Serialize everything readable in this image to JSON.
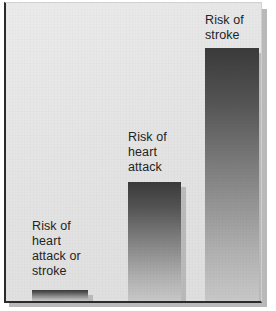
{
  "chart_data": {
    "type": "bar",
    "title": "",
    "subtitle": "",
    "xlabel": "",
    "ylabel": "",
    "grid": false,
    "legend": "none",
    "orientation": "vertical",
    "ylim": [
      0,
      100
    ],
    "categories": [
      "Risk of heart attack or stroke",
      "Risk of heart attack",
      "Risk of stroke"
    ],
    "values": [
      4,
      40,
      86
    ],
    "value_unit": "relative risk reduction (%)",
    "series": [
      {
        "name": "Risk reduction",
        "values": [
          4,
          40,
          86
        ]
      }
    ]
  },
  "bars": [
    {
      "name": "bar-heart-attack-or-stroke",
      "label_lines": "Risk of\nheart\nattack or\nstroke",
      "value": 4,
      "left_px": 26,
      "width_px": 56,
      "height_px": 11,
      "label_top_px": 216
    },
    {
      "name": "bar-heart-attack",
      "label_lines": "Risk of\nheart\nattack",
      "value": 40,
      "left_px": 122,
      "width_px": 53,
      "height_px": 119,
      "label_top_px": 127
    },
    {
      "name": "bar-stroke",
      "label_lines": "Risk of\nstroke",
      "value": 86,
      "left_px": 199,
      "width_px": 54,
      "height_px": 253,
      "label_top_px": 10
    }
  ],
  "colors": {
    "panel_background": "#e6e6e6",
    "panel_border": "#2b2b2b",
    "bar_top": "#3a3a3a",
    "bar_bottom": "#c8c8c8",
    "bar_shadow": "#9b9b9b",
    "label_text": "#242424",
    "page_background": "#ffffff"
  }
}
